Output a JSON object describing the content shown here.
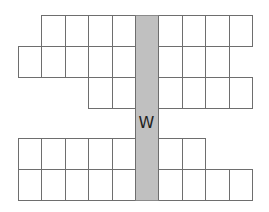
{
  "diagram": {
    "cell_width": 23.4,
    "cell_height": 31,
    "grid_left": 18,
    "rows": [
      {
        "top": 15,
        "left_cells": [
          1,
          2,
          3,
          4
        ],
        "right_cells": [
          6,
          7,
          8,
          9
        ]
      },
      {
        "top": 46,
        "left_cells": [
          0,
          1,
          2,
          3,
          4
        ],
        "right_cells": [
          6,
          7,
          8
        ]
      },
      {
        "top": 77,
        "left_cells": [
          3,
          4
        ],
        "right_cells": [
          6,
          7,
          8,
          9
        ]
      },
      {
        "top": 138,
        "left_cells": [
          0,
          1,
          2,
          3,
          4
        ],
        "right_cells": [
          6,
          7
        ]
      },
      {
        "top": 169,
        "left_cells": [
          0,
          1,
          2,
          3,
          4
        ],
        "right_cells": [
          6,
          7,
          8,
          9
        ]
      }
    ],
    "shaded_column": {
      "col": 5,
      "top": 15,
      "bottom": 200,
      "color": "#c0c0c0",
      "label": "W",
      "label_top": 113
    },
    "line_color": "#6e6e6e"
  }
}
